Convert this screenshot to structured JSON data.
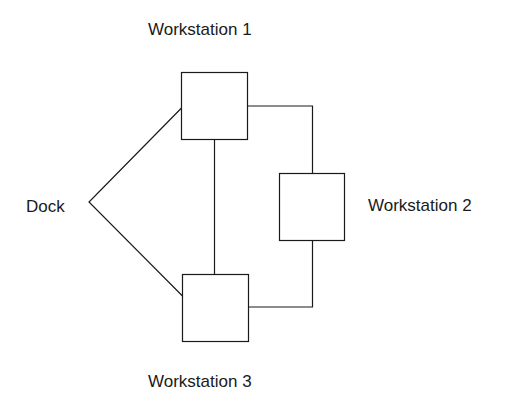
{
  "diagram": {
    "nodes": [
      {
        "id": "dock",
        "label": "Dock"
      },
      {
        "id": "ws1",
        "label": "Workstation 1"
      },
      {
        "id": "ws2",
        "label": "Workstation 2"
      },
      {
        "id": "ws3",
        "label": "Workstation 3"
      }
    ],
    "edges": [
      {
        "from": "dock",
        "to": "ws1"
      },
      {
        "from": "dock",
        "to": "ws3"
      },
      {
        "from": "ws1",
        "to": "ws3"
      },
      {
        "from": "ws1",
        "to": "ws2"
      },
      {
        "from": "ws2",
        "to": "ws3"
      }
    ],
    "colors": {
      "stroke": "#1a1a1a",
      "background": "#ffffff"
    }
  }
}
